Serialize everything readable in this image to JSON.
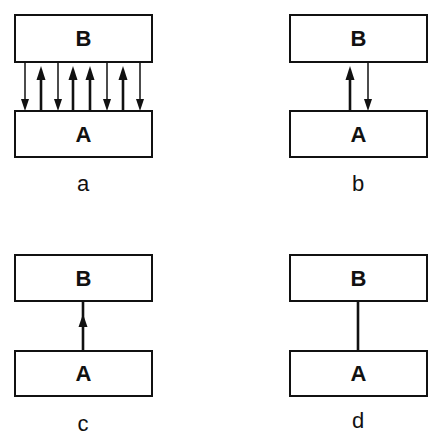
{
  "diagram": {
    "panels": [
      {
        "id": "a",
        "label": "a",
        "top_box": "B",
        "bottom_box": "A",
        "connection": "many bidirectional arrows",
        "arrows": [
          "down",
          "up",
          "down",
          "up",
          "up",
          "down",
          "up",
          "down"
        ]
      },
      {
        "id": "b",
        "label": "b",
        "top_box": "B",
        "bottom_box": "A",
        "connection": "one up arrow and one down arrow",
        "arrows": [
          "up",
          "down"
        ]
      },
      {
        "id": "c",
        "label": "c",
        "top_box": "B",
        "bottom_box": "A",
        "connection": "single up arrow",
        "arrows": [
          "up"
        ]
      },
      {
        "id": "d",
        "label": "d",
        "top_box": "B",
        "bottom_box": "A",
        "connection": "plain line (no arrowhead)",
        "arrows": []
      }
    ],
    "colors": {
      "stroke": "#111111",
      "background": "#ffffff"
    }
  }
}
